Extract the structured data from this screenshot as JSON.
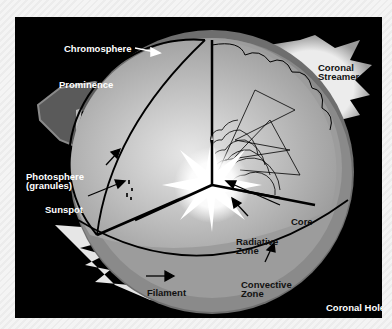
{
  "diagram": {
    "labels": {
      "chromosphere": "Chromosphere",
      "prominence": "Prominence",
      "coronal_streamer_1": "Coronal",
      "coronal_streamer_2": "Streamer",
      "photosphere_1": "Photosphere",
      "photosphere_2": "(granules)",
      "sunspot": "Sunspot",
      "core": "Core",
      "radiative_1": "Radiative",
      "radiative_2": "Zone",
      "filament": "Filament",
      "convective_1": "Convective",
      "convective_2": "Zone",
      "coronal_hole": "Coronal Hole"
    },
    "colors": {
      "background": "#000000",
      "chromosphere_shell": "#6e6e6e",
      "convective_zone": "#9a9a9a",
      "radiative_zone": "#b8b8b8",
      "corona": "#d0d0d0",
      "core_glow": "#ffffff"
    }
  }
}
